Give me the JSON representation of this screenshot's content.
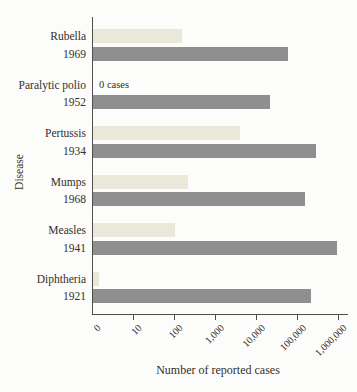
{
  "chart_data": {
    "type": "bar",
    "orientation": "horizontal",
    "x_scale": "log-decades",
    "xlabel": "Number of reported cases",
    "ylabel": "Disease",
    "legend_position": "none",
    "grid": false,
    "values_estimated_from_log_axis": true,
    "x_ticks": [
      {
        "label": "0",
        "value": 0
      },
      {
        "label": "10",
        "value": 10
      },
      {
        "label": "100",
        "value": 100
      },
      {
        "label": "1,000",
        "value": 1000
      },
      {
        "label": "10,000",
        "value": 10000
      },
      {
        "label": "100,000",
        "value": 100000
      },
      {
        "label": "1,000,000",
        "value": 1000000
      }
    ],
    "groups": [
      {
        "disease": "Rubella",
        "year": "1969",
        "light_value": 150,
        "dark_value": 58000,
        "note": ""
      },
      {
        "disease": "Paralytic polio",
        "year": "1952",
        "light_value": 0,
        "dark_value": 21000,
        "note": "0 cases"
      },
      {
        "disease": "Pertussis",
        "year": "1934",
        "light_value": 3800,
        "dark_value": 270000,
        "note": ""
      },
      {
        "disease": "Mumps",
        "year": "1968",
        "light_value": 210,
        "dark_value": 150000,
        "note": ""
      },
      {
        "disease": "Measles",
        "year": "1941",
        "light_value": 100,
        "dark_value": 900000,
        "note": ""
      },
      {
        "disease": "Diphtheria",
        "year": "1921",
        "light_value": 1.4,
        "dark_value": 210000,
        "note": ""
      }
    ],
    "colors": {
      "light_bar": "#e9e8d9",
      "dark_bar": "#8f8f8f",
      "axis": "#4f4f4f",
      "text": "#34302b",
      "background": "#fcfcfa"
    }
  }
}
